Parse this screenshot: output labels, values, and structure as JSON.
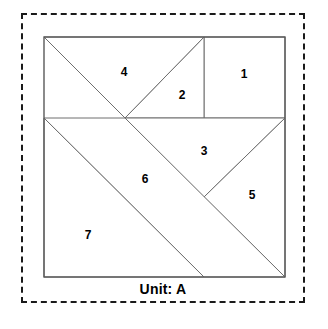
{
  "figure": {
    "caption": "Unit: A",
    "frame_style": "dashed",
    "frame_color": "#1a1a1a",
    "background_color": "#ffffff",
    "piece_fill": "#ffffff",
    "piece_stroke": "#6e6e6e",
    "outline_stroke": "#5a5a5a",
    "label_color": "#000000"
  },
  "tangram": {
    "square": {
      "left": 44,
      "top": 37,
      "right": 285,
      "bottom": 277
    },
    "pieces": [
      {
        "id": 1,
        "label": "1",
        "name": "small-square",
        "points": "204,37 285,37 285,118 204,118",
        "label_x": 244,
        "label_y": 75
      },
      {
        "id": 2,
        "label": "2",
        "name": "small-triangle-upper",
        "points": "125,118 204,37 204,118",
        "label_x": 182,
        "label_y": 96
      },
      {
        "id": 3,
        "label": "3",
        "name": "medium-triangle",
        "points": "125,118 285,118 204,197",
        "label_x": 204,
        "label_y": 152
      },
      {
        "id": 4,
        "label": "4",
        "name": "large-triangle-top",
        "points": "44,37 204,37 125,118",
        "label_x": 124,
        "label_y": 73
      },
      {
        "id": 5,
        "label": "5",
        "name": "small-triangle-right",
        "points": "204,197 285,118 285,277",
        "label_x": 252,
        "label_y": 196
      },
      {
        "id": 6,
        "label": "6",
        "name": "parallelogram",
        "points": "44,118 125,118 285,277 204,277",
        "label_x": 145,
        "label_y": 180
      },
      {
        "id": 7,
        "label": "7",
        "name": "large-triangle-bottom-left",
        "points": "44,118 204,277 44,277",
        "label_x": 88,
        "label_y": 236
      }
    ]
  }
}
